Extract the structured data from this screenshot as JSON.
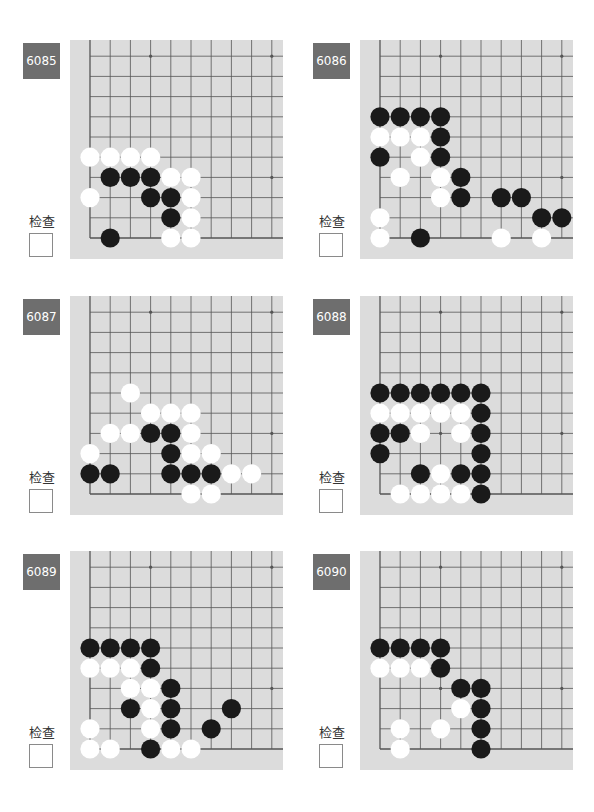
{
  "page": {
    "check_label": "检查",
    "colors": {
      "label_bg": "#6e6e6e",
      "board_bg": "#dcdcdc",
      "grid_line": "#555555",
      "black_stone": "#1a1a1a",
      "white_stone": "#ffffff"
    }
  },
  "board_geometry": {
    "columns": 10,
    "rows": 10,
    "spacing": 20.2,
    "corner": "bottom-left",
    "star_points": [
      [
        3,
        9
      ],
      [
        9,
        9
      ],
      [
        9,
        3
      ],
      [
        3,
        3
      ]
    ]
  },
  "puzzles": [
    {
      "id": "6085",
      "black": [
        [
          1,
          3
        ],
        [
          2,
          3
        ],
        [
          3,
          3
        ],
        [
          3,
          2
        ],
        [
          4,
          2
        ],
        [
          4,
          1
        ],
        [
          1,
          0
        ]
      ],
      "white": [
        [
          0,
          4
        ],
        [
          1,
          4
        ],
        [
          2,
          4
        ],
        [
          3,
          4
        ],
        [
          4,
          3
        ],
        [
          5,
          3
        ],
        [
          0,
          2
        ],
        [
          5,
          2
        ],
        [
          5,
          1
        ],
        [
          4,
          0
        ],
        [
          5,
          0
        ]
      ]
    },
    {
      "id": "6086",
      "black": [
        [
          0,
          6
        ],
        [
          1,
          6
        ],
        [
          2,
          6
        ],
        [
          3,
          6
        ],
        [
          3,
          5
        ],
        [
          0,
          4
        ],
        [
          3,
          4
        ],
        [
          4,
          3
        ],
        [
          4,
          2
        ],
        [
          6,
          2
        ],
        [
          7,
          2
        ],
        [
          8,
          1
        ],
        [
          9,
          1
        ],
        [
          2,
          0
        ]
      ],
      "white": [
        [
          0,
          5
        ],
        [
          1,
          5
        ],
        [
          2,
          5
        ],
        [
          2,
          4
        ],
        [
          1,
          3
        ],
        [
          3,
          3
        ],
        [
          3,
          2
        ],
        [
          0,
          1
        ],
        [
          0,
          0
        ],
        [
          6,
          0
        ],
        [
          8,
          0
        ]
      ]
    },
    {
      "id": "6087",
      "black": [
        [
          3,
          3
        ],
        [
          4,
          3
        ],
        [
          4,
          2
        ],
        [
          0,
          1
        ],
        [
          1,
          1
        ],
        [
          4,
          1
        ],
        [
          5,
          1
        ],
        [
          6,
          1
        ]
      ],
      "white": [
        [
          2,
          5
        ],
        [
          3,
          4
        ],
        [
          4,
          4
        ],
        [
          5,
          4
        ],
        [
          1,
          3
        ],
        [
          2,
          3
        ],
        [
          5,
          3
        ],
        [
          0,
          2
        ],
        [
          5,
          2
        ],
        [
          6,
          2
        ],
        [
          7,
          1
        ],
        [
          8,
          1
        ],
        [
          5,
          0
        ],
        [
          6,
          0
        ]
      ]
    },
    {
      "id": "6088",
      "black": [
        [
          0,
          5
        ],
        [
          1,
          5
        ],
        [
          2,
          5
        ],
        [
          3,
          5
        ],
        [
          4,
          5
        ],
        [
          5,
          5
        ],
        [
          5,
          4
        ],
        [
          0,
          3
        ],
        [
          1,
          3
        ],
        [
          5,
          3
        ],
        [
          0,
          2
        ],
        [
          5,
          2
        ],
        [
          2,
          1
        ],
        [
          4,
          1
        ],
        [
          5,
          1
        ],
        [
          5,
          0
        ]
      ],
      "white": [
        [
          0,
          4
        ],
        [
          1,
          4
        ],
        [
          2,
          4
        ],
        [
          3,
          4
        ],
        [
          4,
          4
        ],
        [
          2,
          3
        ],
        [
          4,
          3
        ],
        [
          3,
          1
        ],
        [
          1,
          0
        ],
        [
          2,
          0
        ],
        [
          3,
          0
        ],
        [
          4,
          0
        ]
      ]
    },
    {
      "id": "6089",
      "black": [
        [
          0,
          5
        ],
        [
          1,
          5
        ],
        [
          2,
          5
        ],
        [
          3,
          5
        ],
        [
          3,
          4
        ],
        [
          4,
          3
        ],
        [
          2,
          2
        ],
        [
          4,
          2
        ],
        [
          7,
          2
        ],
        [
          4,
          1
        ],
        [
          6,
          1
        ],
        [
          3,
          0
        ]
      ],
      "white": [
        [
          0,
          4
        ],
        [
          1,
          4
        ],
        [
          2,
          4
        ],
        [
          2,
          3
        ],
        [
          3,
          3
        ],
        [
          3,
          2
        ],
        [
          0,
          1
        ],
        [
          3,
          1
        ],
        [
          0,
          0
        ],
        [
          1,
          0
        ],
        [
          4,
          0
        ],
        [
          5,
          0
        ]
      ]
    },
    {
      "id": "6090",
      "black": [
        [
          0,
          5
        ],
        [
          1,
          5
        ],
        [
          2,
          5
        ],
        [
          3,
          5
        ],
        [
          3,
          4
        ],
        [
          4,
          3
        ],
        [
          5,
          3
        ],
        [
          5,
          2
        ],
        [
          5,
          1
        ],
        [
          5,
          0
        ]
      ],
      "white": [
        [
          0,
          4
        ],
        [
          1,
          4
        ],
        [
          2,
          4
        ],
        [
          4,
          2
        ],
        [
          1,
          1
        ],
        [
          3,
          1
        ],
        [
          1,
          0
        ]
      ]
    }
  ]
}
